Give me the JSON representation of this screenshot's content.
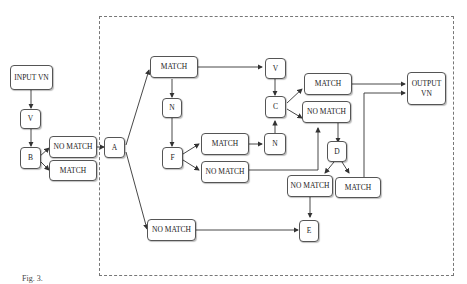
{
  "diagram": {
    "nodes": {
      "input": "INPUT VN",
      "v1": "V",
      "b": "B",
      "b_no_match": "NO MATCH",
      "b_match": "MATCH",
      "a": "A",
      "a_match": "MATCH",
      "a_no_match": "NO MATCH",
      "n1": "N",
      "f": "F",
      "f_match": "MATCH",
      "f_no_match": "NO MATCH",
      "n2": "N",
      "v2": "V",
      "c": "C",
      "c_match": "MATCH",
      "c_no_match": "NO MATCH",
      "d": "D",
      "d_no_match": "NO MATCH",
      "d_match": "MATCH",
      "e": "E",
      "output_line1": "OUTPUT",
      "output_line2": "VN"
    },
    "edges": [
      [
        "input",
        "v1"
      ],
      [
        "v1",
        "b"
      ],
      [
        "b",
        "b_no_match"
      ],
      [
        "b",
        "b_match"
      ],
      [
        "b_no_match",
        "a"
      ],
      [
        "a",
        "a_match"
      ],
      [
        "a",
        "a_no_match"
      ],
      [
        "a_match",
        "v2"
      ],
      [
        "a_match",
        "n1"
      ],
      [
        "n1",
        "f"
      ],
      [
        "f",
        "f_match"
      ],
      [
        "f",
        "f_no_match"
      ],
      [
        "f_match",
        "n2"
      ],
      [
        "n2",
        "c"
      ],
      [
        "v2",
        "c"
      ],
      [
        "c",
        "c_match"
      ],
      [
        "c",
        "c_no_match"
      ],
      [
        "f_no_match",
        "c_no_match"
      ],
      [
        "c_no_match",
        "d"
      ],
      [
        "c_match",
        "output"
      ],
      [
        "d",
        "d_no_match"
      ],
      [
        "d",
        "d_match"
      ],
      [
        "d_match",
        "output"
      ],
      [
        "d_no_match",
        "e"
      ],
      [
        "a_no_match",
        "e"
      ]
    ],
    "caption": "Fig. 3."
  }
}
